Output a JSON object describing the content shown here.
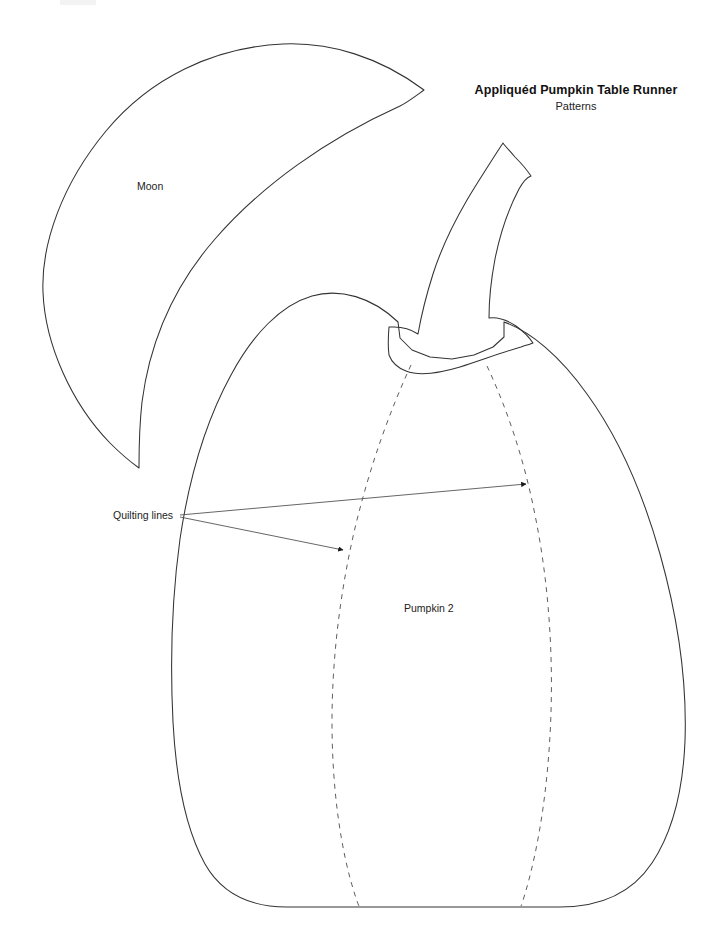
{
  "document": {
    "title": "Appliquéd Pumpkin Table Runner",
    "subtitle": "Patterns",
    "page_background": "#ffffff",
    "ink_color": "#333333"
  },
  "labels": {
    "moon": "Moon",
    "pumpkin": "Pumpkin 2",
    "quilting": "Quilting lines"
  },
  "shapes": [
    {
      "name": "moon",
      "label": "Moon",
      "style": "solid-outline",
      "stroke": "#333333",
      "fill": "none"
    },
    {
      "name": "pumpkin-body",
      "label": "Pumpkin 2",
      "style": "solid-outline",
      "stroke": "#333333",
      "fill": "none"
    },
    {
      "name": "pumpkin-stem",
      "label": "",
      "style": "solid-outline",
      "stroke": "#333333",
      "fill": "none"
    },
    {
      "name": "quilting-line-left",
      "label": "Quilting lines",
      "style": "dashed",
      "stroke": "#555555",
      "fill": "none"
    },
    {
      "name": "quilting-line-right",
      "label": "Quilting lines",
      "style": "dashed",
      "stroke": "#555555",
      "fill": "none"
    }
  ],
  "annotations": {
    "leader_count": 2,
    "arrow_targets": [
      "quilting-line-right",
      "quilting-line-left"
    ]
  }
}
